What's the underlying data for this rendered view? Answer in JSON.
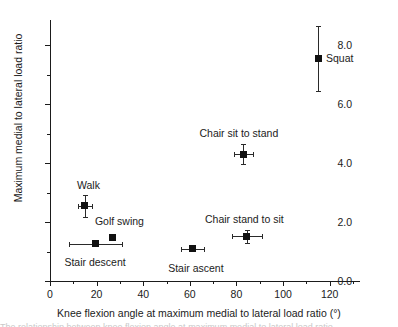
{
  "chart_data": {
    "type": "scatter",
    "title": "",
    "xlabel": "Knee flexion angle at maximum medial to lateral load ratio (°)",
    "ylabel": "Maximum medial to lateral load ratio",
    "xlim": [
      0,
      133
    ],
    "ylim": [
      0,
      8.85
    ],
    "xticks": [
      0,
      20,
      40,
      60,
      80,
      100,
      120
    ],
    "xtick_labels": [
      "0",
      "20",
      "40",
      "60",
      "80",
      "100",
      "120"
    ],
    "yticks": [
      0.0,
      2.0,
      4.0,
      6.0,
      8.0
    ],
    "ytick_labels": [
      "0.0",
      "2.0",
      "4.0",
      "6.0",
      "8.0"
    ],
    "x_minor_ticks": [
      10,
      30,
      50,
      70,
      90,
      110,
      130
    ],
    "y_minor_ticks": [
      1.0,
      3.0,
      5.0,
      7.0
    ],
    "grid": false,
    "legend": "none",
    "marker_style": "filled-square",
    "marker_color": "#111111",
    "error_bar_color": "#2a2a2a",
    "axis_color": "#1b1b1b",
    "points": [
      {
        "name": "walk",
        "label": "Walk",
        "x": 15.0,
        "y": 2.55,
        "xerr": 3.0,
        "yerr": 0.38,
        "label_dx": -8,
        "label_dy": -26
      },
      {
        "name": "stair-descent",
        "label": "Stair descent",
        "x": 19.5,
        "y": 1.26,
        "xerr": 11.5,
        "yerr": 0.0,
        "label_dx": -31,
        "label_dy": 13
      },
      {
        "name": "golf-swing",
        "label": "Golf swing",
        "x": 27.0,
        "y": 1.46,
        "xerr": 0.0,
        "yerr": 0.0,
        "label_dx": -18,
        "label_dy": -22
      },
      {
        "name": "stair-ascent",
        "label": "Stair ascent",
        "x": 61.0,
        "y": 1.1,
        "xerr": 5.0,
        "yerr": 0.0,
        "label_dx": -24,
        "label_dy": 14
      },
      {
        "name": "chair-sit-to-stand",
        "label": "Chair sit to stand",
        "x": 83.0,
        "y": 4.3,
        "xerr": 4.0,
        "yerr": 0.35,
        "label_dx": -44,
        "label_dy": -26
      },
      {
        "name": "chair-stand-to-sit",
        "label": "Chair stand to sit",
        "x": 84.5,
        "y": 1.52,
        "xerr": 6.5,
        "yerr": 0.22,
        "label_dx": -42,
        "label_dy": -22
      },
      {
        "name": "squat",
        "label": "Squat",
        "x": 115.0,
        "y": 7.55,
        "xerr": 0.0,
        "yerr": 1.1,
        "label_dx": 8,
        "label_dy": -5
      }
    ]
  },
  "caption_sliver": "The relationship between knee flexion angle at maximum medial to lateral load ratio"
}
